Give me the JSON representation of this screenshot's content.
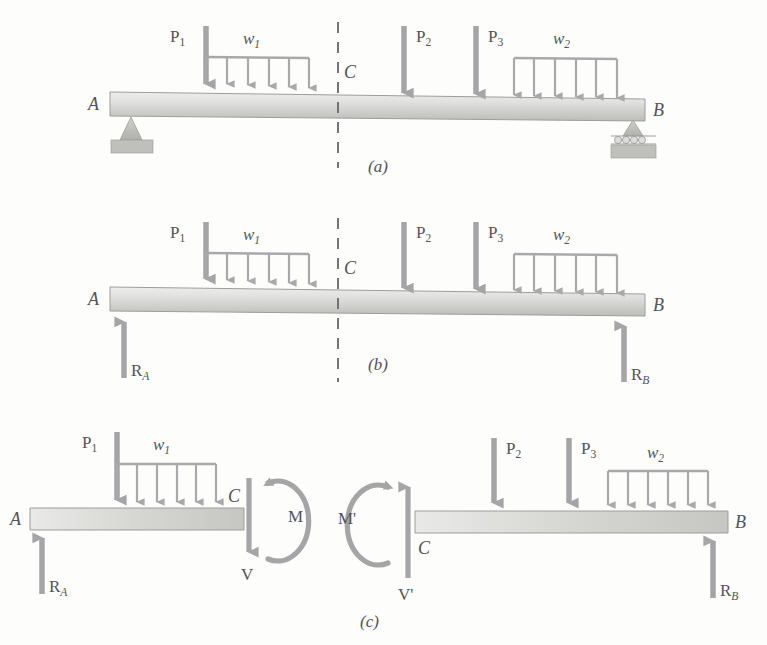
{
  "figure": {
    "title_caption_a": "(a)",
    "title_caption_b": "(b)",
    "title_caption_c": "(c)",
    "colors": {
      "beam_light": "#e6e6e4",
      "beam_mid": "#d0d0ce",
      "beam_dark": "#b9b9b6",
      "arrow": "#a3a3a6",
      "arrow_dark": "#8e8e93",
      "text": "#53535a",
      "background": "#fdfdfb",
      "support": "#bdbdbb",
      "dash": "#6e6e72"
    }
  },
  "panels": [
    {
      "id": "a",
      "caption": "(a)",
      "description": "Simply supported beam with pin support at A and roller support at B, subjected to point loads and distributed loads, with section cut at C",
      "beam_ends": {
        "left_label": "A",
        "right_label": "B"
      },
      "section_label": "C",
      "supports": [
        {
          "name": "pin-support",
          "at": "A"
        },
        {
          "name": "roller-support",
          "at": "B"
        }
      ],
      "point_loads": [
        {
          "label": "P",
          "subscript": "1"
        },
        {
          "label": "P",
          "subscript": "2"
        },
        {
          "label": "P",
          "subscript": "3"
        }
      ],
      "distributed_loads": [
        {
          "label": "w",
          "subscript": "1",
          "arrows": 6
        },
        {
          "label": "w",
          "subscript": "2",
          "arrows": 6
        }
      ],
      "reactions": []
    },
    {
      "id": "b",
      "caption": "(b)",
      "description": "Free-body diagram of whole beam showing support reactions R_A and R_B",
      "beam_ends": {
        "left_label": "A",
        "right_label": "B"
      },
      "section_label": "C",
      "supports": [],
      "point_loads": [
        {
          "label": "P",
          "subscript": "1"
        },
        {
          "label": "P",
          "subscript": "2"
        },
        {
          "label": "P",
          "subscript": "3"
        }
      ],
      "distributed_loads": [
        {
          "label": "w",
          "subscript": "1",
          "arrows": 6
        },
        {
          "label": "w",
          "subscript": "2",
          "arrows": 6
        }
      ],
      "reactions": [
        {
          "label": "R",
          "subscript": "A",
          "direction": "up"
        },
        {
          "label": "R",
          "subscript": "B",
          "direction": "up"
        }
      ]
    },
    {
      "id": "c",
      "caption": "(c)",
      "description": "Two separated free-body diagrams of the beam segments cut at C, showing internal shear V and moment M on each face",
      "left_segment": {
        "beam_ends": {
          "left_label": "A",
          "right_label": "C"
        },
        "point_loads": [
          {
            "label": "P",
            "subscript": "1"
          }
        ],
        "distributed_loads": [
          {
            "label": "w",
            "subscript": "1",
            "arrows": 6
          }
        ],
        "reactions": [
          {
            "label": "R",
            "subscript": "A",
            "direction": "up"
          }
        ],
        "internal_forces": [
          {
            "label": "V",
            "type": "shear",
            "direction": "down"
          },
          {
            "label": "M",
            "type": "moment",
            "direction": "counterclockwise-arc"
          }
        ]
      },
      "right_segment": {
        "beam_ends": {
          "left_label": "C",
          "right_label": "B"
        },
        "point_loads": [
          {
            "label": "P",
            "subscript": "2"
          },
          {
            "label": "P",
            "subscript": "3"
          }
        ],
        "distributed_loads": [
          {
            "label": "w",
            "subscript": "2",
            "arrows": 6
          }
        ],
        "reactions": [
          {
            "label": "R",
            "subscript": "B",
            "direction": "up"
          }
        ],
        "internal_forces": [
          {
            "label": "V'",
            "type": "shear",
            "direction": "up"
          },
          {
            "label": "M'",
            "type": "moment",
            "direction": "clockwise-arc"
          }
        ]
      }
    }
  ],
  "labels": {
    "A": "A",
    "B": "B",
    "C": "C",
    "P1_main": "P",
    "P1_sub": "1",
    "P2_main": "P",
    "P2_sub": "2",
    "P3_main": "P",
    "P3_sub": "3",
    "w1_main": "w",
    "w1_sub": "1",
    "w2_main": "w",
    "w2_sub": "2",
    "RA_main": "R",
    "RA_sub": "A",
    "RB_main": "R",
    "RB_sub": "B",
    "V": "V",
    "Vp": "V'",
    "M": "M",
    "Mp": "M'",
    "cap_a": "(a)",
    "cap_b": "(b)",
    "cap_c": "(c)"
  }
}
